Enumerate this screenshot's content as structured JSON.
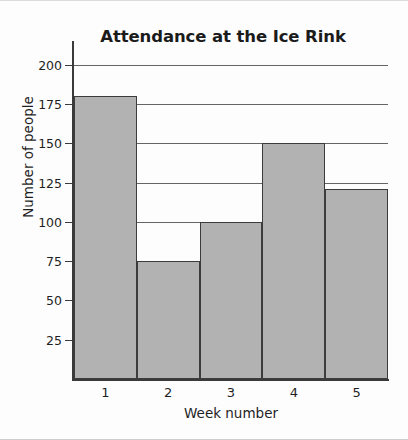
{
  "chart_data": {
    "type": "bar",
    "title": "Attendance at the Ice Rink",
    "xlabel": "Week number",
    "ylabel": "Number of people",
    "categories": [
      "1",
      "2",
      "3",
      "4",
      "5"
    ],
    "values": [
      180,
      75,
      100,
      150,
      121
    ],
    "ylim": [
      0,
      210
    ],
    "yticks": [
      25,
      50,
      75,
      100,
      125,
      150,
      175,
      200
    ],
    "ytick_labels": [
      "25",
      "50",
      "75",
      "100",
      "125",
      "150",
      "175",
      "200"
    ],
    "grid": true,
    "legend": null,
    "bar_color": "#b2b2b2",
    "bar_edge_color": "#3c3c3c",
    "axis_color": "#3a3a3a",
    "text_color": "#1f1f1f",
    "background": "#fdfdfd",
    "bars_adjacent": true
  }
}
